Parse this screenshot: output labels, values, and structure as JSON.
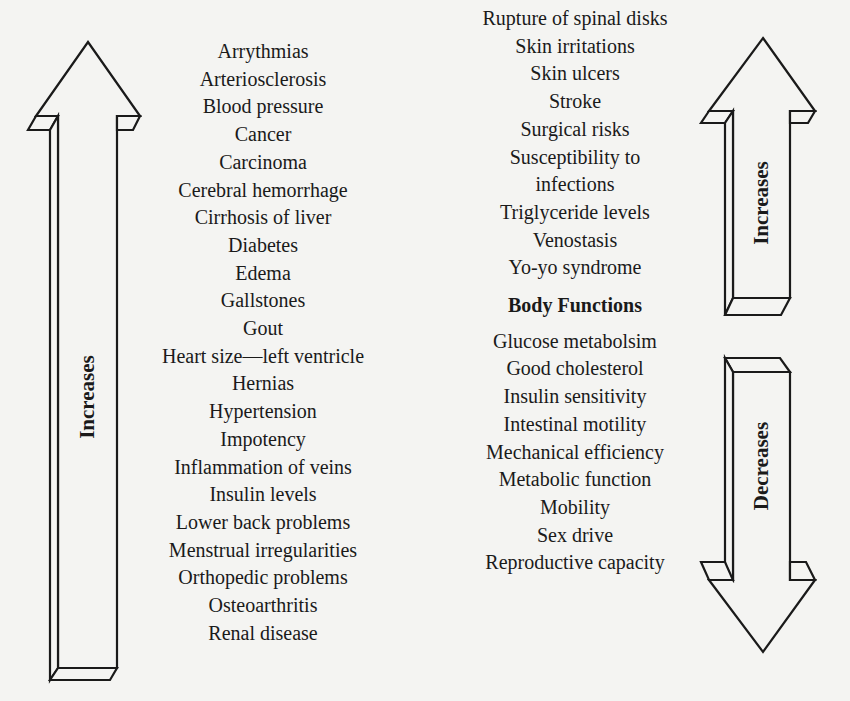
{
  "header": {
    "title_partial": ""
  },
  "left_arrow": {
    "label": "Increases",
    "direction": "up"
  },
  "right_top_arrow": {
    "label": "Increases",
    "direction": "up"
  },
  "right_bottom_arrow": {
    "label": "Decreases",
    "direction": "down"
  },
  "left_column": {
    "items": [
      "Arrythmias",
      "Arteriosclerosis",
      "Blood pressure",
      "Cancer",
      "Carcinoma",
      "Cerebral hemorrhage",
      "Cirrhosis of liver",
      "Diabetes",
      "Edema",
      "Gallstones",
      "Gout",
      "Heart size—left ventricle",
      "Hernias",
      "Hypertension",
      "Impotency",
      "Inflammation of veins",
      "Insulin levels",
      "Lower back problems",
      "Menstrual irregularities",
      "Orthopedic problems",
      "Osteoarthritis",
      "Renal disease"
    ]
  },
  "right_column": {
    "increases_items": [
      "Rupture of spinal disks",
      "Skin irritations",
      "Skin ulcers",
      "Stroke",
      "Surgical risks",
      "Susceptibility to",
      "infections",
      "Triglyceride levels",
      "Venostasis",
      "Yo-yo syndrome"
    ],
    "section_title": "Body Functions",
    "decreases_items": [
      "Glucose metabolsim",
      "Good cholesterol",
      "Insulin sensitivity",
      "Intestinal motility",
      "Mechanical efficiency",
      "Metabolic function",
      "Mobility",
      "Sex drive",
      "Reproductive capacity"
    ]
  },
  "colors": {
    "ink": "#1a1a1a",
    "paper": "#f4f4f2"
  }
}
